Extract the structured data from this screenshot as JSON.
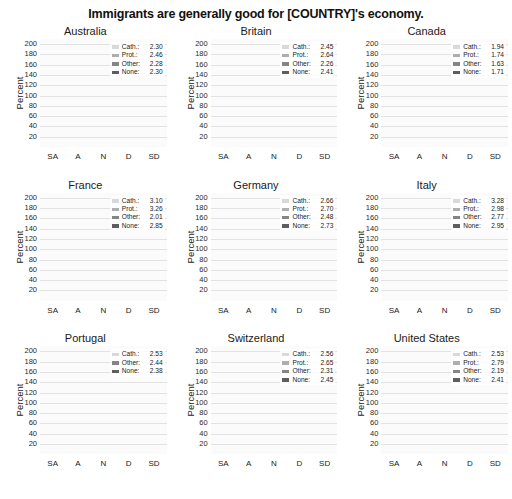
{
  "chart_data": {
    "type": "bar",
    "title": "Immigrants are generally good for [COUNTRY]'s economy.",
    "layout": "3x3 small-multiples of stacked bar charts",
    "stacked": true,
    "categories": [
      "SA",
      "A",
      "N",
      "D",
      "SD"
    ],
    "xlabel": "",
    "ylabel": "Percent",
    "ylim": [
      0,
      210
    ],
    "yticks": [
      20,
      40,
      60,
      80,
      100,
      120,
      140,
      160,
      180,
      200
    ],
    "grid": true,
    "legend_position": "top-right inside each panel",
    "series_order": [
      "None",
      "Other",
      "Prot.",
      "Cath."
    ],
    "series_colors": {
      "Cath.": "#d9d9d9",
      "Prot.": "#aeaeae",
      "Other": "#858585",
      "None": "#5e5e5e"
    },
    "panels": [
      {
        "name": "Australia",
        "legend": [
          {
            "label": "Cath.:",
            "value": "2.30",
            "key": "Cath."
          },
          {
            "label": "Prot.:",
            "value": "2.46",
            "key": "Prot."
          },
          {
            "label": "Other:",
            "value": "2.28",
            "key": "Other"
          },
          {
            "label": "None:",
            "value": "2.30",
            "key": "None"
          }
        ],
        "series": [
          {
            "name": "None",
            "values": [
              40,
              72,
              38,
              22,
              12
            ]
          },
          {
            "name": "Other",
            "values": [
              17,
              30,
              17,
              8,
              5
            ]
          },
          {
            "name": "Prot.",
            "values": [
              17,
              28,
              12,
              6,
              4
            ]
          },
          {
            "name": "Cath.",
            "values": [
              16,
              45,
              9,
              5,
              3
            ]
          }
        ],
        "totals": [
          90,
          175,
          76,
          41,
          24
        ]
      },
      {
        "name": "Britain",
        "legend": [
          {
            "label": "Cath.:",
            "value": "2.45",
            "key": "Cath."
          },
          {
            "label": "Prot.:",
            "value": "2.64",
            "key": "Prot."
          },
          {
            "label": "Other:",
            "value": "2.26",
            "key": "Other"
          },
          {
            "label": "None:",
            "value": "2.41",
            "key": "None"
          }
        ],
        "series": [
          {
            "name": "None",
            "values": [
              38,
              72,
              40,
              26,
              16
            ]
          },
          {
            "name": "Other",
            "values": [
              14,
              32,
              18,
              11,
              5
            ]
          },
          {
            "name": "Prot.",
            "values": [
              10,
              22,
              11,
              8,
              3
            ]
          },
          {
            "name": "Cath.",
            "values": [
              9,
              56,
              9,
              6,
              2
            ]
          }
        ],
        "totals": [
          71,
          182,
          78,
          51,
          26
        ]
      },
      {
        "name": "Canada",
        "legend": [
          {
            "label": "Cath.:",
            "value": "1.94",
            "key": "Cath."
          },
          {
            "label": "Prot.:",
            "value": "1.74",
            "key": "Prot."
          },
          {
            "label": "Other:",
            "value": "1.63",
            "key": "Other"
          },
          {
            "label": "None:",
            "value": "1.71",
            "key": "None"
          }
        ],
        "series": [
          {
            "name": "None",
            "values": [
              62,
              55,
              7,
              6,
              3
            ]
          },
          {
            "name": "Other",
            "values": [
              52,
              45,
              4,
              3,
              2
            ]
          },
          {
            "name": "Prot.",
            "values": [
              42,
              38,
              3,
              3,
              1
            ]
          },
          {
            "name": "Cath.",
            "values": [
              34,
              20,
              2,
              2,
              1
            ]
          }
        ],
        "totals": [
          190,
          158,
          16,
          14,
          7
        ]
      },
      {
        "name": "France",
        "legend": [
          {
            "label": "Cath.:",
            "value": "3.10",
            "key": "Cath."
          },
          {
            "label": "Prot.:",
            "value": "3.26",
            "key": "Prot."
          },
          {
            "label": "Other:",
            "value": "2.01",
            "key": "Other"
          },
          {
            "label": "None:",
            "value": "2.85",
            "key": "None"
          }
        ],
        "series": [
          {
            "name": "None",
            "values": [
              44,
              85,
              32,
              24,
              20
            ]
          },
          {
            "name": "Other",
            "values": [
              7,
              10,
              26,
              16,
              13
            ]
          },
          {
            "name": "Prot.",
            "values": [
              4,
              10,
              18,
              14,
              11
            ]
          },
          {
            "name": "Cath.",
            "values": [
              4,
              23,
              14,
              11,
              9
            ]
          }
        ],
        "totals": [
          59,
          128,
          90,
          65,
          53
        ]
      },
      {
        "name": "Germany",
        "legend": [
          {
            "label": "Cath.:",
            "value": "2.66",
            "key": "Cath."
          },
          {
            "label": "Prot.:",
            "value": "2.70",
            "key": "Prot."
          },
          {
            "label": "Other:",
            "value": "2.48",
            "key": "Other"
          },
          {
            "label": "None:",
            "value": "2.73",
            "key": "None"
          }
        ],
        "series": [
          {
            "name": "None",
            "values": [
              28,
              50,
              74,
              22,
              12
            ]
          },
          {
            "name": "Other",
            "values": [
              12,
              25,
              44,
              12,
              4
            ]
          },
          {
            "name": "Prot.",
            "values": [
              9,
              22,
              24,
              9,
              2
            ]
          },
          {
            "name": "Cath.",
            "values": [
              6,
              23,
              18,
              8,
              2
            ]
          }
        ],
        "totals": [
          55,
          120,
          160,
          51,
          20
        ]
      },
      {
        "name": "Italy",
        "legend": [
          {
            "label": "Cath.:",
            "value": "3.28",
            "key": "Cath."
          },
          {
            "label": "Prot.:",
            "value": "2.98",
            "key": "Prot."
          },
          {
            "label": "Other:",
            "value": "2.77",
            "key": "Other"
          },
          {
            "label": "None:",
            "value": "2.95",
            "key": "None"
          }
        ],
        "series": [
          {
            "name": "None",
            "values": [
              22,
              78,
              24,
              30,
              28
            ]
          },
          {
            "name": "Other",
            "values": [
              10,
              28,
              20,
              22,
              20
            ]
          },
          {
            "name": "Prot.",
            "values": [
              5,
              18,
              11,
              13,
              12
            ]
          },
          {
            "name": "Cath.",
            "values": [
              4,
              20,
              9,
              11,
              10
            ]
          }
        ],
        "totals": [
          41,
          144,
          64,
          76,
          70
        ]
      },
      {
        "name": "Portugal",
        "legend": [
          {
            "label": "Cath.:",
            "value": "2.53",
            "key": "Cath."
          },
          {
            "label": "Other:",
            "value": "2.44",
            "key": "Other"
          },
          {
            "label": "None:",
            "value": "2.38",
            "key": "None"
          }
        ],
        "series": [
          {
            "name": "None",
            "values": [
              14,
              48,
              45,
              19,
              2
            ]
          },
          {
            "name": "Other",
            "values": [
              3,
              66,
              5,
              4,
              1
            ]
          },
          {
            "name": "Cath.",
            "values": [
              2,
              50,
              22,
              15,
              1
            ]
          }
        ],
        "totals": [
          19,
          164,
          72,
          38,
          4
        ]
      },
      {
        "name": "Switzerland",
        "legend": [
          {
            "label": "Cath.:",
            "value": "2.56",
            "key": "Cath."
          },
          {
            "label": "Prot.:",
            "value": "2.65",
            "key": "Prot."
          },
          {
            "label": "Other:",
            "value": "2.31",
            "key": "Other"
          },
          {
            "label": "None:",
            "value": "2.45",
            "key": "None"
          }
        ],
        "series": [
          {
            "name": "None",
            "values": [
              28,
              92,
              62,
              22,
              10
            ]
          },
          {
            "name": "Other",
            "values": [
              12,
              50,
              18,
              18,
              3
            ]
          },
          {
            "name": "Prot.",
            "values": [
              5,
              24,
              8,
              10,
              1
            ]
          },
          {
            "name": "Cath.",
            "values": [
              5,
              18,
              5,
              8,
              1
            ]
          }
        ],
        "totals": [
          50,
          184,
          93,
          58,
          15
        ]
      },
      {
        "name": "United States",
        "legend": [
          {
            "label": "Cath.:",
            "value": "2.53",
            "key": "Cath."
          },
          {
            "label": "Prot.:",
            "value": "2.79",
            "key": "Prot."
          },
          {
            "label": "Other:",
            "value": "2.19",
            "key": "Other"
          },
          {
            "label": "None:",
            "value": "2.41",
            "key": "None"
          }
        ],
        "series": [
          {
            "name": "None",
            "values": [
              30,
              46,
              44,
              18,
              8
            ]
          },
          {
            "name": "Other",
            "values": [
              26,
              42,
              34,
              14,
              4
            ]
          },
          {
            "name": "Prot.",
            "values": [
              12,
              36,
              16,
              12,
              2
            ]
          },
          {
            "name": "Cath.",
            "values": [
              8,
              25,
              10,
              10,
              2
            ]
          }
        ],
        "totals": [
          76,
          149,
          104,
          54,
          16
        ]
      }
    ]
  }
}
